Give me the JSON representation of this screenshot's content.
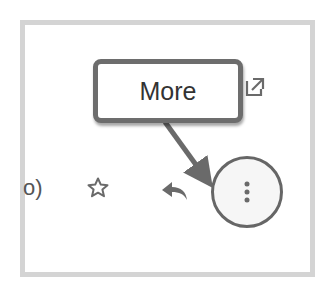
{
  "toolbar": {
    "truncated_text": "o)",
    "star_label": "star-icon",
    "reply_label": "reply-icon",
    "popout_label": "open-in-new-window-icon",
    "more_label": "more-vert-icon"
  },
  "annotation": {
    "callout_text": "More"
  },
  "colors": {
    "frame_border": "#d4d4d4",
    "icon": "#666666",
    "callout_border": "#6d6d6d",
    "more_button_bg": "#f6f6f6"
  }
}
